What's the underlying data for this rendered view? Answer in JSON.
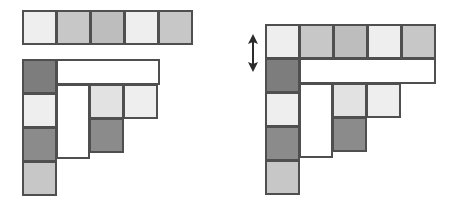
{
  "canvas": {
    "width": 454,
    "height": 215,
    "background": "#ffffff"
  },
  "palette": {
    "outline": "#4f4f4f",
    "pale": "#eeeeee",
    "light": "#e2e2e2",
    "mid": "#c7c7c7",
    "midgray": "#bdbdbd",
    "dark": "#7d7d7d",
    "darker": "#8b8b8b",
    "empty": "#ffffff"
  },
  "cell_size": 33,
  "figures": [
    {
      "id": "left-figure",
      "name": "detached-strip-diagram",
      "label": "",
      "origin": {
        "x": 22,
        "y": 10
      },
      "detached_strip": {
        "name": "detached-row-strip",
        "row": 0,
        "col": 0,
        "count": 5,
        "shades": [
          "pale",
          "mid",
          "midgray",
          "pale",
          "mid"
        ]
      },
      "staircase": {
        "name": "staircase-shape",
        "left_column": {
          "col": 0,
          "start_row": 0,
          "shades": [
            "dark",
            "pale",
            "darker",
            "mid"
          ]
        },
        "white_bar": {
          "name": "empty-row-bar",
          "row": 0,
          "col": 1,
          "span": 4
        },
        "inner_rows": [
          {
            "row": 1,
            "col": 2,
            "shades": [
              "light",
              "pale"
            ]
          },
          {
            "row": 2,
            "col": 2,
            "shades": [
              "darker"
            ]
          }
        ],
        "empty_notch": {
          "name": "empty-notch-column",
          "col": 1,
          "start_row": 1,
          "span": 3
        }
      },
      "arrow": null
    },
    {
      "id": "right-figure",
      "name": "attached-strip-diagram",
      "label": "",
      "origin": {
        "x": 265,
        "y": 24
      },
      "attached_strip": {
        "name": "attached-top-row",
        "row": 0,
        "col": 0,
        "count": 5,
        "shades": [
          "pale",
          "mid",
          "midgray",
          "pale",
          "mid"
        ]
      },
      "staircase": {
        "name": "staircase-shape",
        "left_column": {
          "col": 0,
          "start_row": 1,
          "shades": [
            "dark",
            "pale",
            "darker",
            "mid"
          ]
        },
        "white_bar": {
          "name": "empty-row-bar",
          "row": 1,
          "col": 1,
          "span": 4
        },
        "inner_rows": [
          {
            "row": 2,
            "col": 2,
            "shades": [
              "light",
              "pale"
            ]
          },
          {
            "row": 3,
            "col": 2,
            "shades": [
              "darker"
            ]
          }
        ],
        "empty_notch": {
          "name": "empty-notch-column",
          "col": 1,
          "start_row": 2,
          "span": 3
        }
      },
      "arrow": {
        "name": "vertical-double-arrow",
        "direction": "up-down",
        "x": 248,
        "y": 36,
        "width": 10,
        "height": 34,
        "color": "#2b2b2b"
      }
    }
  ]
}
